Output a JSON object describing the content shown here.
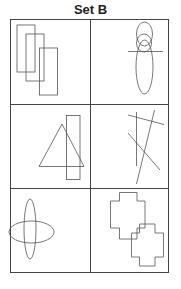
{
  "title": "Set B",
  "grid": {
    "rows": 3,
    "cols": 2
  },
  "stroke_color": "#555555",
  "cells": [
    {
      "row": 1,
      "col": 1,
      "content": "three overlapping vertical rectangles, stepped diagonally"
    },
    {
      "row": 1,
      "col": 2,
      "content": "tall ellipse with smaller circles at top, crossed by a horizontal line"
    },
    {
      "row": 2,
      "col": 1,
      "content": "triangle overlapping a tall narrow rectangle"
    },
    {
      "row": 2,
      "col": 2,
      "content": "four intersecting straight lines"
    },
    {
      "row": 3,
      "col": 1,
      "content": "vertical and horizontal ellipses crossing"
    },
    {
      "row": 3,
      "col": 2,
      "content": "two overlapping cross/plus-shaped outlines"
    }
  ]
}
